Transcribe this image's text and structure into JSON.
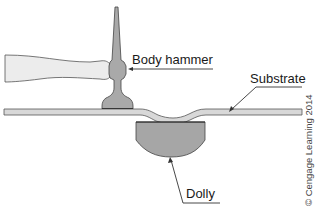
{
  "diagram": {
    "labels": {
      "hammer": "Body hammer",
      "substrate": "Substrate",
      "dolly": "Dolly"
    },
    "copyright": "© Cengage Learning 2014",
    "colors": {
      "handle_fill": "#ececec",
      "hammer_head_fill": "#a9a9a9",
      "substrate_fill": "#d8d8d8",
      "dolly_fill": "#a6a6a6",
      "outline": "#3a3a3a",
      "background": "#ffffff"
    }
  }
}
